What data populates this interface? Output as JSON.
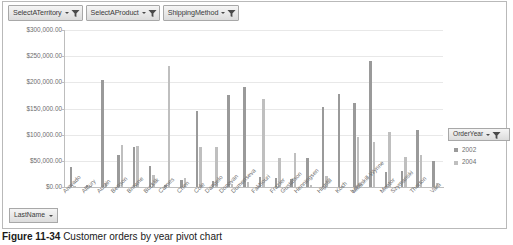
{
  "filters": [
    {
      "label": "SelectATerritory",
      "icon": "filter-funnel-icon"
    },
    {
      "label": "SelectAProduct",
      "icon": "filter-funnel-icon"
    },
    {
      "label": "ShippingMethod",
      "icon": "filter-funnel-icon"
    }
  ],
  "legend": {
    "title": "OrderYear",
    "icon": "filter-funnel-icon",
    "items": [
      {
        "label": "2002",
        "color": "#9a9a9a"
      },
      {
        "label": "2004",
        "color": "#bfbfbf"
      }
    ]
  },
  "field_button": {
    "label": "LastName",
    "icon": "chevron-down-icon"
  },
  "caption": {
    "figure": "Figure 11-34",
    "text": " Customer orders by year pivot chart"
  },
  "chart_data": {
    "type": "bar",
    "title": "",
    "xlabel": "LastName",
    "ylabel": "",
    "ylim": [
      0,
      300000
    ],
    "yticks": [
      0,
      50000,
      100000,
      150000,
      200000,
      250000,
      300000
    ],
    "ytick_labels": [
      "$0.00",
      "$50,000.00",
      "$100,000.00",
      "$150,000.00",
      "$200,000.00",
      "$250,000.00",
      "$300,000.00"
    ],
    "grid": true,
    "legend_position": "right",
    "categories": [
      "Arevado",
      "Albury",
      "Austin",
      "Benson",
      "Browne",
      "Bucklik",
      "Carnes",
      "Chen",
      "Cole",
      "Dangelo",
      "Donovan",
      "Dumenseva",
      "Fakhouri",
      "Frazier",
      "Gustafson",
      "Henningsen",
      "Highfill",
      "Koch",
      "Long",
      "McAskill-Wynne",
      "Mentor",
      "Szymanski",
      "Thorton",
      "Vara"
    ],
    "series": [
      {
        "name": "2002",
        "color": "#9a9a9a",
        "values": [
          38000,
          3000,
          205000,
          62000,
          76000,
          41000,
          3000,
          14000,
          145000,
          12000,
          175000,
          192000,
          20000,
          18000,
          16000,
          55000,
          152000,
          178000,
          160000,
          240000,
          28000,
          30000,
          108000,
          50000
        ]
      },
      {
        "name": "2004",
        "color": "#bfbfbf",
        "values": [
          2000,
          1000,
          7000,
          80000,
          78000,
          23000,
          232000,
          17000,
          76000,
          77000,
          6000,
          9000,
          168000,
          55000,
          65000,
          4000,
          22000,
          2000,
          96000,
          86000,
          105000,
          58000,
          61000,
          8000
        ]
      }
    ]
  }
}
